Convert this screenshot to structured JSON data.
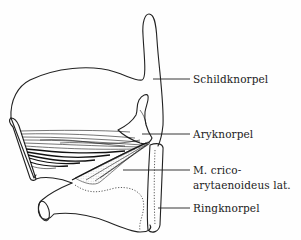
{
  "figure": {
    "type": "anatomical line drawing",
    "labels": [
      {
        "id": "schildknorpel",
        "text": "Schildknorpel",
        "x": 193,
        "y": 73
      },
      {
        "id": "aryknorpel",
        "text": "Aryknorpel",
        "x": 193,
        "y": 128
      },
      {
        "id": "m-cricoarytaenoideus-lat-line1",
        "text": "M. crico-",
        "x": 193,
        "y": 164
      },
      {
        "id": "m-cricoarytaenoideus-lat-line2",
        "text": "arytaenoideus lat.",
        "x": 193,
        "y": 179
      },
      {
        "id": "ringknorpel",
        "text": "Ringknorpel",
        "x": 193,
        "y": 202
      }
    ],
    "leaders": [
      {
        "for": "schildknorpel",
        "x1": 153,
        "y1": 79,
        "x2": 190,
        "y2": 79
      },
      {
        "for": "aryknorpel",
        "x1": 142,
        "y1": 134,
        "x2": 190,
        "y2": 134
      },
      {
        "for": "m-cricoarytaenoideus-lat",
        "x1": 123,
        "y1": 170,
        "x2": 190,
        "y2": 170
      },
      {
        "for": "ringknorpel",
        "x1": 158,
        "y1": 208,
        "x2": 190,
        "y2": 208
      }
    ],
    "colors": {
      "ink": "#222222",
      "background": "#fefefe",
      "stipple": "#9a9a9a"
    }
  }
}
